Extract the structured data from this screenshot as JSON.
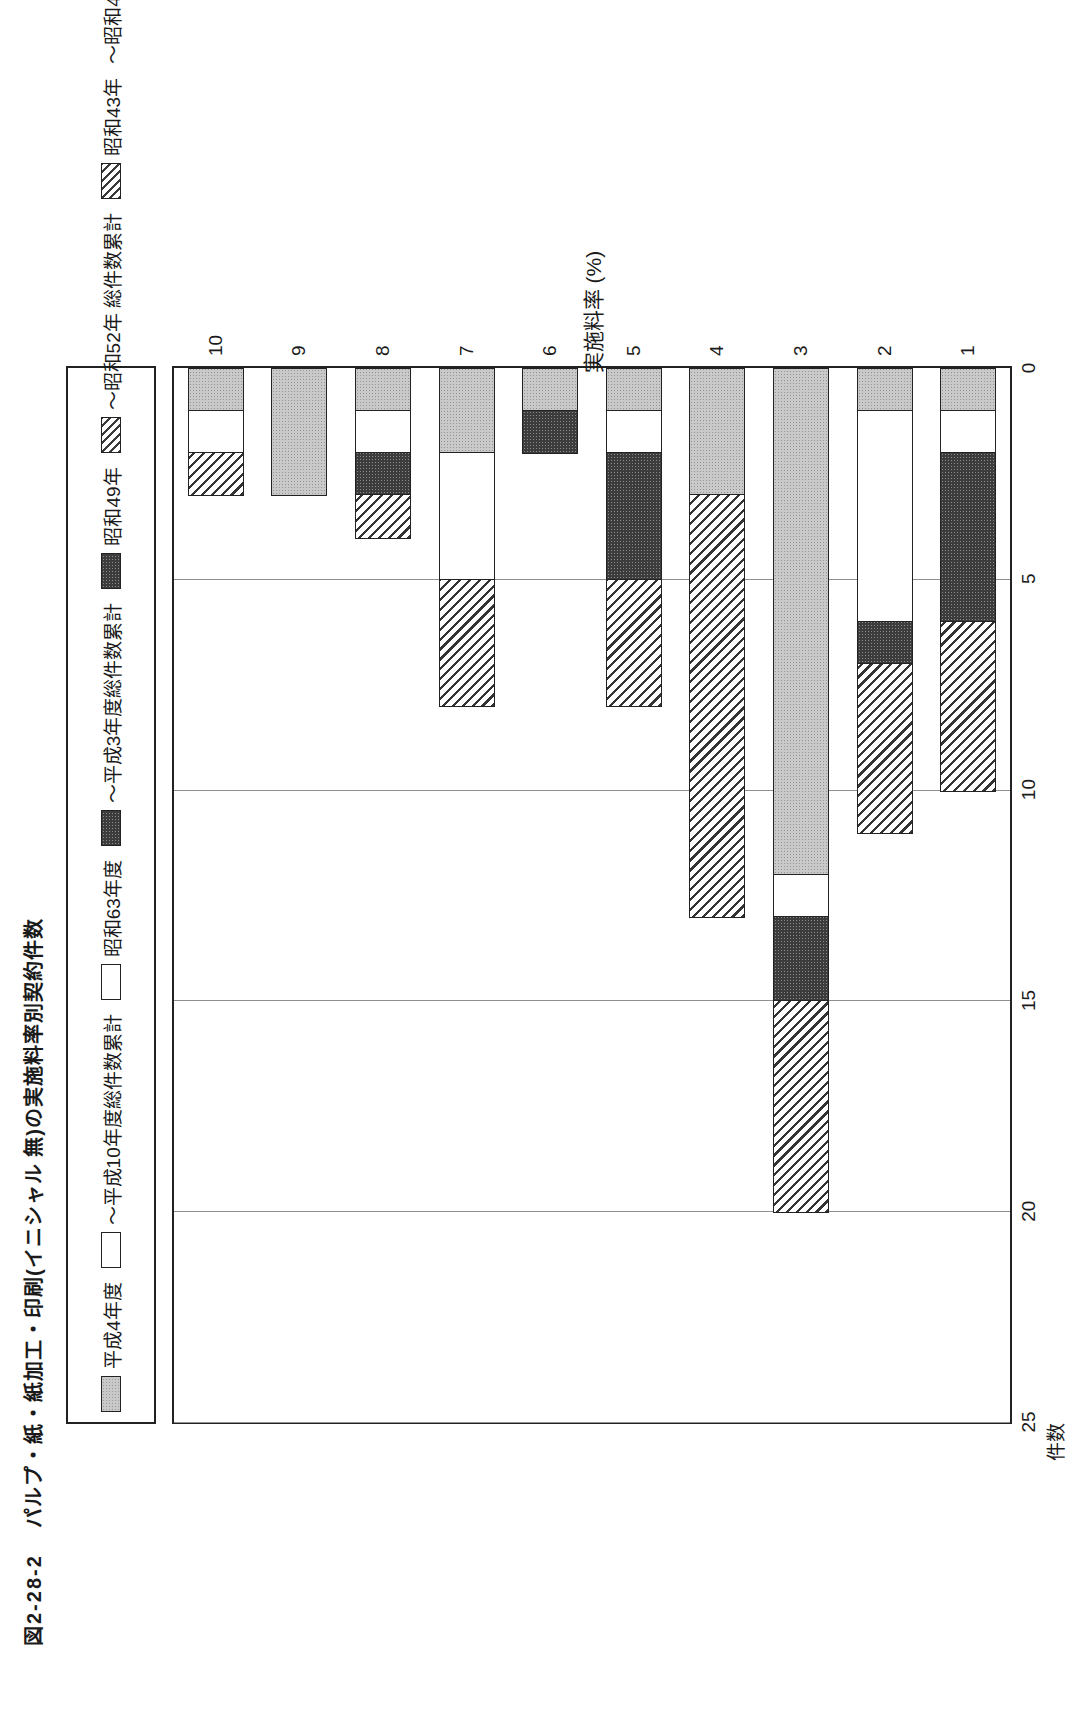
{
  "figure": {
    "title_number": "図2-28-2",
    "title_text": "パルプ・紙・紙加工・印刷(イニシャル 無)の実施料率別契約件数"
  },
  "legend": {
    "items": [
      {
        "swatch": "gray",
        "label": "平成4年度"
      },
      {
        "swatch": "white",
        "label": "～平成10年度総件数累計"
      },
      {
        "swatch": "white",
        "label": "昭和63年度"
      },
      {
        "swatch": "dark",
        "label": "～平成3年度総件数累計"
      },
      {
        "swatch": "dark",
        "label": "昭和49年"
      },
      {
        "swatch": "hatch",
        "label": "～昭和52年 総件数累計"
      },
      {
        "swatch": "hatch",
        "label": "昭和43年"
      },
      {
        "swatch": "none",
        "label": "～昭和48年 総件数累計"
      }
    ],
    "series_names": [
      "平成4年度～平成10年度総件数累計",
      "昭和63年度～平成3年度総件数累計",
      "昭和49年～昭和52年 総件数累計",
      "昭和43年～昭和48年 総件数累計"
    ]
  },
  "axes": {
    "value_axis_name": "件数",
    "value_ticks": [
      "0",
      "5",
      "10",
      "15",
      "20",
      "25"
    ],
    "category_axis_name": "実施料率 (%)",
    "category_ticks": [
      "1",
      "2",
      "3",
      "4",
      "5",
      "6",
      "7",
      "8",
      "9",
      "10"
    ]
  },
  "chart_data": {
    "type": "bar",
    "orientation": "horizontal-stacked",
    "xlabel": "実施料率 (%)",
    "ylabel": "件数",
    "ylim": [
      0,
      25
    ],
    "grid": true,
    "legend_position": "top",
    "categories": [
      "1",
      "2",
      "3",
      "4",
      "5",
      "6",
      "7",
      "8",
      "9",
      "10"
    ],
    "series": [
      {
        "name": "昭和43年～昭和48年 総件数累計",
        "swatch": "hatch",
        "values": [
          4,
          4,
          5,
          10,
          3,
          0,
          3,
          1,
          0,
          1
        ]
      },
      {
        "name": "昭和49年～昭和52年 総件数累計",
        "swatch": "dark",
        "values": [
          4,
          1,
          2,
          0,
          3,
          1,
          0,
          1,
          0,
          0
        ]
      },
      {
        "name": "昭和63年度～平成3年度総件数累計",
        "swatch": "white",
        "values": [
          1,
          5,
          1,
          0,
          1,
          0,
          3,
          1,
          0,
          1
        ]
      },
      {
        "name": "平成4年度～平成10年度総件数累計",
        "swatch": "gray",
        "values": [
          1,
          1,
          12,
          3,
          1,
          1,
          2,
          1,
          3,
          1
        ]
      }
    ],
    "totals": [
      10,
      11,
      20,
      13,
      8,
      2,
      8,
      4,
      3,
      3
    ]
  },
  "colors": {
    "gray": "#c9c9c9",
    "white": "#ffffff",
    "dark": "#3c3c3c",
    "hatch": "#333333",
    "axis": "#222222",
    "grid": "#8f8f8f"
  }
}
